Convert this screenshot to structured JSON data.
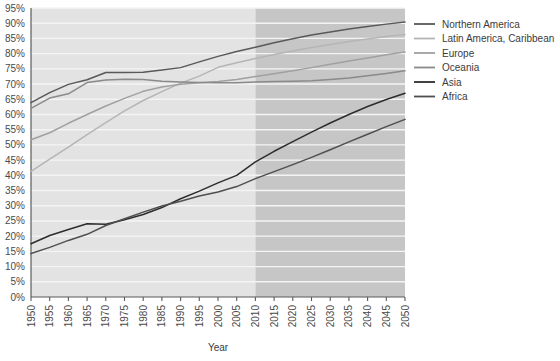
{
  "chart_data": {
    "type": "line",
    "title": "",
    "xlabel": "Year",
    "ylabel": "",
    "xlim": [
      1950,
      2050
    ],
    "ylim": [
      0,
      95
    ],
    "grid": true,
    "legend_position": "right",
    "x": [
      1950,
      1955,
      1960,
      1965,
      1970,
      1975,
      1980,
      1985,
      1990,
      1995,
      2000,
      2005,
      2010,
      2015,
      2020,
      2025,
      2030,
      2035,
      2040,
      2045,
      2050
    ],
    "xtick_labels": [
      "1950",
      "1955",
      "1960",
      "1965",
      "1970",
      "1975",
      "1980",
      "1985",
      "1990",
      "1995",
      "2000",
      "2005",
      "2010",
      "2015",
      "2020",
      "2025",
      "2030",
      "2035",
      "2040",
      "2045",
      "2050"
    ],
    "ytick_labels": [
      "0%",
      "5%",
      "10%",
      "15%",
      "20%",
      "25%",
      "30%",
      "35%",
      "40%",
      "45%",
      "50%",
      "55%",
      "60%",
      "65%",
      "70%",
      "75%",
      "80%",
      "85%",
      "90%",
      "95%"
    ],
    "ytick_values": [
      0,
      5,
      10,
      15,
      20,
      25,
      30,
      35,
      40,
      45,
      50,
      55,
      60,
      65,
      70,
      75,
      80,
      85,
      90,
      95
    ],
    "projection_start": 2010,
    "annotations": {
      "historical_band_label": "historical",
      "projection_band_label": "projection"
    },
    "series": [
      {
        "name": "Northern America",
        "color": "#595959",
        "values": [
          63.9,
          67.2,
          69.9,
          71.4,
          73.8,
          73.8,
          73.9,
          74.6,
          75.4,
          77.3,
          79.1,
          80.7,
          82.1,
          83.6,
          84.9,
          86.1,
          87.1,
          88.1,
          88.9,
          89.7,
          90.4
        ]
      },
      {
        "name": "Latin America, Caribbean",
        "color": "#b5b5b5",
        "values": [
          41.3,
          45.3,
          49.3,
          53.4,
          57.3,
          61.2,
          64.6,
          67.5,
          70.3,
          72.6,
          75.5,
          77.0,
          78.4,
          79.7,
          80.9,
          82.0,
          83.0,
          84.0,
          84.8,
          85.6,
          86.3
        ]
      },
      {
        "name": "Europe",
        "color": "#a0a0a0",
        "values": [
          51.7,
          54.0,
          57.1,
          60.0,
          62.8,
          65.3,
          67.6,
          69.0,
          69.9,
          70.4,
          70.8,
          71.5,
          72.5,
          73.4,
          74.4,
          75.4,
          76.5,
          77.6,
          78.6,
          79.6,
          80.5
        ]
      },
      {
        "name": "Oceania",
        "color": "#8a8a8a",
        "values": [
          62.0,
          65.4,
          66.8,
          70.5,
          71.3,
          71.6,
          71.5,
          70.9,
          70.7,
          70.5,
          70.4,
          70.4,
          70.7,
          70.8,
          70.9,
          71.1,
          71.5,
          72.0,
          72.7,
          73.5,
          74.4
        ]
      },
      {
        "name": "Asia",
        "color": "#2d2d2d",
        "values": [
          17.5,
          20.2,
          22.2,
          24.1,
          23.9,
          25.4,
          27.1,
          29.4,
          32.3,
          34.8,
          37.5,
          40.0,
          44.4,
          47.9,
          51.1,
          54.2,
          57.2,
          60.0,
          62.6,
          64.9,
          67.0
        ]
      },
      {
        "name": "Africa",
        "color": "#4f4f4f",
        "values": [
          14.3,
          16.3,
          18.6,
          20.6,
          23.5,
          25.7,
          27.9,
          29.9,
          31.5,
          33.2,
          34.5,
          36.3,
          38.9,
          41.2,
          43.5,
          45.9,
          48.4,
          51.0,
          53.5,
          56.0,
          58.4
        ]
      }
    ]
  },
  "legend": {
    "items": [
      {
        "label": "Northern America"
      },
      {
        "label": "Latin America, Caribbean"
      },
      {
        "label": "Europe"
      },
      {
        "label": "Oceania"
      },
      {
        "label": "Asia"
      },
      {
        "label": "Africa"
      }
    ]
  },
  "colors": {
    "plot_background_historical": "#e3e3e3",
    "plot_background_projection": "#c6c6c6",
    "gridline": "#f4f4f4",
    "axis": "#5a5a5a",
    "page_background": "#ffffff"
  }
}
